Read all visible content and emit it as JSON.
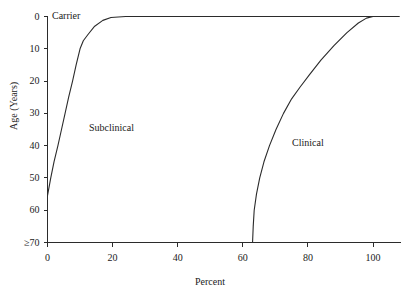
{
  "chart_data": {
    "type": "area",
    "title": "",
    "xlabel": "Percent",
    "ylabel": "Age (Years)",
    "xlim": [
      0,
      108
    ],
    "ylim": [
      0,
      70
    ],
    "y_axis_inverted": true,
    "grid": false,
    "legend_position": "none",
    "xticks": [
      "0",
      "20",
      "40",
      "60",
      "80",
      "100"
    ],
    "xtick_values": [
      0,
      20,
      40,
      60,
      80,
      100
    ],
    "yticks": [
      "0",
      "10",
      "20",
      "30",
      "40",
      "50",
      "60",
      "≥70"
    ],
    "ytick_values": [
      0,
      10,
      20,
      30,
      40,
      50,
      60,
      70
    ],
    "annotations": [
      {
        "text": "Carrier",
        "x": 1.5,
        "y": 1.5
      },
      {
        "text": "Subclinical",
        "x": 13,
        "y": 34
      },
      {
        "text": "Clinical",
        "x": 75,
        "y": 38
      }
    ],
    "series": [
      {
        "name": "Carrier boundary",
        "comment": "Left boundary separating Carrier band from Subclinical region; percent as function of age",
        "points": [
          {
            "percent": 0.0,
            "age": 55.5
          },
          {
            "percent": 1.0,
            "age": 50.0
          },
          {
            "percent": 2.0,
            "age": 45.0
          },
          {
            "percent": 3.2,
            "age": 40.0
          },
          {
            "percent": 4.3,
            "age": 35.0
          },
          {
            "percent": 5.4,
            "age": 30.0
          },
          {
            "percent": 6.5,
            "age": 25.0
          },
          {
            "percent": 7.7,
            "age": 20.0
          },
          {
            "percent": 8.8,
            "age": 15.0
          },
          {
            "percent": 10.0,
            "age": 10.0
          },
          {
            "percent": 11.0,
            "age": 7.5
          },
          {
            "percent": 12.5,
            "age": 5.5
          },
          {
            "percent": 14.5,
            "age": 3.0
          },
          {
            "percent": 17.0,
            "age": 1.2
          },
          {
            "percent": 19.5,
            "age": 0.3
          },
          {
            "percent": 24.0,
            "age": 0.0
          },
          {
            "percent": 108.0,
            "age": 0.0
          }
        ]
      },
      {
        "name": "Clinical boundary",
        "comment": "Right boundary separating Subclinical region from Clinical region; percent as function of age",
        "points": [
          {
            "percent": 63.0,
            "age": 70.0
          },
          {
            "percent": 63.2,
            "age": 65.0
          },
          {
            "percent": 63.5,
            "age": 60.0
          },
          {
            "percent": 64.2,
            "age": 55.0
          },
          {
            "percent": 65.2,
            "age": 50.0
          },
          {
            "percent": 66.5,
            "age": 45.0
          },
          {
            "percent": 68.2,
            "age": 40.0
          },
          {
            "percent": 70.2,
            "age": 35.0
          },
          {
            "percent": 72.5,
            "age": 30.0
          },
          {
            "percent": 75.0,
            "age": 25.5
          },
          {
            "percent": 77.5,
            "age": 22.0
          },
          {
            "percent": 80.5,
            "age": 18.0
          },
          {
            "percent": 84.0,
            "age": 13.5
          },
          {
            "percent": 88.0,
            "age": 9.0
          },
          {
            "percent": 92.0,
            "age": 5.0
          },
          {
            "percent": 95.5,
            "age": 2.0
          },
          {
            "percent": 98.0,
            "age": 0.5
          },
          {
            "percent": 100.0,
            "age": 0.0
          },
          {
            "percent": 108.0,
            "age": 0.0
          }
        ]
      }
    ]
  },
  "axes": {
    "x_title": "Percent",
    "y_title": "Age (Years)"
  },
  "colors": {
    "axis": "#2b2b2b",
    "curve": "#2b2b2b",
    "background": "#ffffff",
    "text": "#1a1a1a"
  }
}
